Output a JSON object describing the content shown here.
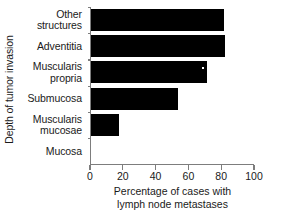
{
  "chart_data": {
    "type": "bar",
    "orientation": "horizontal",
    "title": "",
    "xlabel": "Percentage of cases with lymph node metastases",
    "xlabel_lines": [
      "Percentage of cases with",
      "lymph node metastases"
    ],
    "ylabel": "Depth of tumor invasion",
    "categories": [
      "Other structures",
      "Adventitia",
      "Muscularis propria",
      "Submucosa",
      "Muscularis mucosae",
      "Mucosa"
    ],
    "category_labels": [
      "Other\nstructures",
      "Adventitia",
      "Muscularis\npropria",
      "Submucosa",
      "Muscularis\nmucosae",
      "Mucosa"
    ],
    "values": [
      81,
      82,
      71,
      53,
      17,
      0
    ],
    "xlim": [
      0,
      100
    ],
    "xticks": [
      0,
      20,
      40,
      60,
      80,
      100
    ],
    "xtick_labels": [
      "0",
      "20",
      "40",
      "60",
      "80",
      "100"
    ],
    "grid": false,
    "legend": false,
    "bar_color": "#000000",
    "axis_color": "#7d7d7d",
    "background": "#ffffff"
  }
}
